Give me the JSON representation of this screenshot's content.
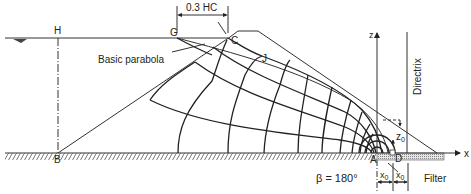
{
  "diagram": {
    "labels": {
      "H": "H",
      "G": "G",
      "C": "C",
      "J": "J",
      "B": "B",
      "A": "A",
      "D": "D",
      "z_axis": "z",
      "x_axis": "x",
      "basic_parabola": "Basic parabola",
      "dimension_gc": "0.3 HC",
      "directrix": "Directrix",
      "z0": "z",
      "z0_sub": "0",
      "x0_left": "x",
      "x0_left_sub": "0",
      "x0_right": "x",
      "x0_right_sub": "0",
      "beta": "β = 180°",
      "filter": "Filter"
    },
    "colors": {
      "line": "#333333",
      "text": "#222222",
      "filter_fill": "#b8b8b8",
      "background": "#ffffff"
    }
  }
}
